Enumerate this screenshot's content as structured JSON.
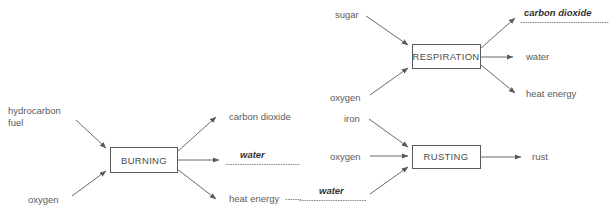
{
  "diagram": {
    "colors": {
      "line": "#6b6b6b",
      "box_stroke": "#5a5a5a",
      "text": "#5c5c5c",
      "emphasis_text": "#333333",
      "background": "#ffffff"
    },
    "processes": [
      {
        "id": "burning",
        "name": "BURNING",
        "inputs": [
          {
            "label": "hydrocarbon",
            "label_line2": "fuel",
            "emphasis": false
          },
          {
            "label": "oxygen",
            "emphasis": false
          }
        ],
        "outputs": [
          {
            "label": "carbon dioxide",
            "emphasis": false,
            "underlined": false
          },
          {
            "label": "water",
            "emphasis": true,
            "underlined": true
          },
          {
            "label": "heat energy",
            "emphasis": false,
            "underlined": false
          }
        ]
      },
      {
        "id": "respiration",
        "name": "RESPIRATION",
        "inputs": [
          {
            "label": "sugar",
            "emphasis": false
          },
          {
            "label": "oxygen",
            "emphasis": false
          }
        ],
        "outputs": [
          {
            "label": "carbon dioxide",
            "emphasis": true,
            "underlined": true
          },
          {
            "label": "water",
            "emphasis": false,
            "underlined": false
          },
          {
            "label": "heat energy",
            "emphasis": false,
            "underlined": false
          }
        ]
      },
      {
        "id": "rusting",
        "name": "RUSTING",
        "inputs": [
          {
            "label": "iron",
            "emphasis": false
          },
          {
            "label": "oxygen",
            "emphasis": false
          },
          {
            "label": "water",
            "emphasis": true,
            "underlined": true
          }
        ],
        "outputs": [
          {
            "label": "rust",
            "emphasis": false,
            "underlined": false
          }
        ]
      }
    ]
  }
}
